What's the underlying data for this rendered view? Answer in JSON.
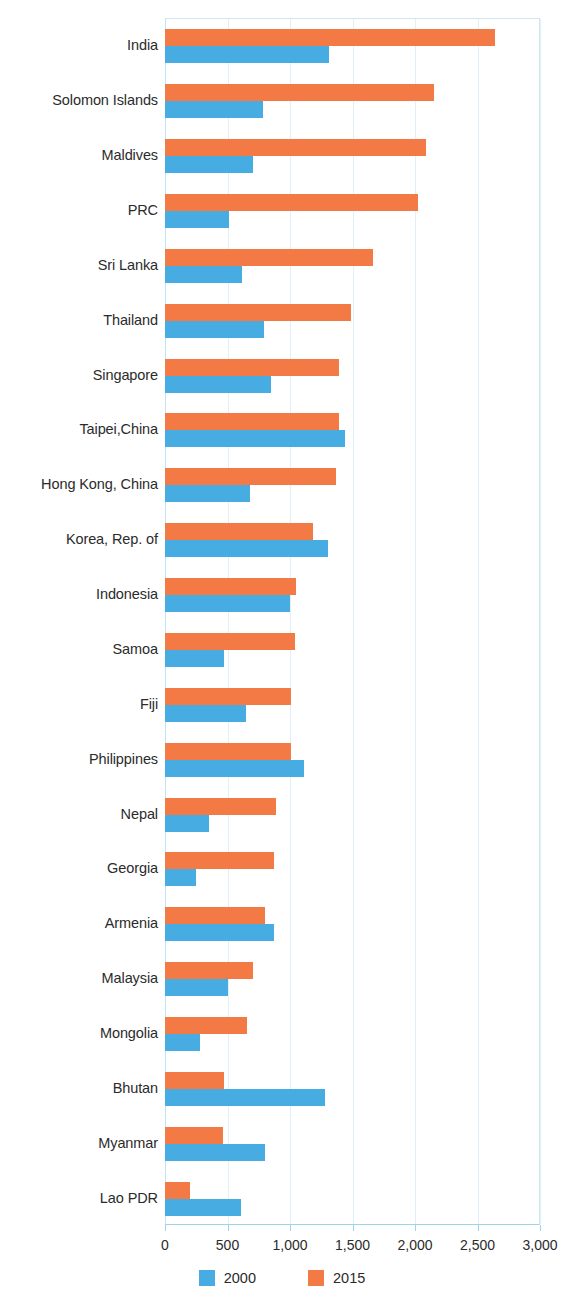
{
  "chart_data": {
    "type": "bar",
    "orientation": "horizontal",
    "title": "",
    "subtitle": "",
    "xlabel": "",
    "ylabel": "",
    "xlim": [
      0,
      3000
    ],
    "xticks": [
      0,
      500,
      1000,
      1500,
      2000,
      2500,
      3000
    ],
    "xtick_labels": [
      "0",
      "500",
      "1,000",
      "1,500",
      "2,000",
      "2,500",
      "3,000"
    ],
    "grid": true,
    "grid_axis": "x",
    "legend_position": "bottom-center",
    "categories": [
      "India",
      "Solomon Islands",
      "Maldives",
      "PRC",
      "Sri Lanka",
      "Thailand",
      "Singapore",
      "Taipei,China",
      "Hong Kong, China",
      "Korea, Rep. of",
      "Indonesia",
      "Samoa",
      "Fiji",
      "Philippines",
      "Nepal",
      "Georgia",
      "Armenia",
      "Malaysia",
      "Mongolia",
      "Bhutan",
      "Myanmar",
      "Lao PDR"
    ],
    "series": [
      {
        "name": "2015",
        "color": "#f47a45",
        "values": [
          2640,
          2150,
          2090,
          2020,
          1665,
          1490,
          1390,
          1390,
          1370,
          1180,
          1050,
          1040,
          1010,
          1010,
          890,
          870,
          800,
          700,
          655,
          470,
          460,
          200
        ]
      },
      {
        "name": "2000",
        "color": "#47ace2",
        "values": [
          1310,
          785,
          700,
          510,
          615,
          790,
          850,
          1440,
          680,
          1300,
          1000,
          470,
          650,
          1110,
          350,
          250,
          870,
          500,
          280,
          1280,
          800,
          610
        ]
      }
    ]
  },
  "legend": {
    "items": [
      {
        "label": "2000",
        "color": "#47ace2"
      },
      {
        "label": "2015",
        "color": "#f47a45"
      }
    ]
  }
}
